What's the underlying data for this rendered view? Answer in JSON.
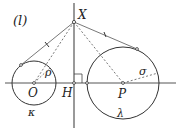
{
  "figure": {
    "panel_label": "(l)",
    "points": {
      "X": "X",
      "O": "O",
      "H": "H",
      "P": "P"
    },
    "radii": {
      "small": "ρ",
      "large": "σ"
    },
    "circles": {
      "small": "κ",
      "large": "λ"
    }
  },
  "colors": {
    "stroke": "#333333",
    "background": "#ffffff"
  }
}
